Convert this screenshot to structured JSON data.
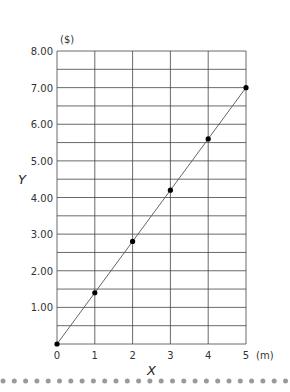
{
  "chart_data": {
    "type": "line",
    "title": "",
    "xlabel": "X",
    "ylabel": "Y",
    "x_unit": "(m)",
    "y_unit": "($)",
    "x": [
      0,
      1,
      2,
      3,
      4,
      5
    ],
    "series": [
      {
        "name": "Y",
        "values": [
          0,
          1.4,
          2.8,
          4.2,
          5.6,
          7.0
        ]
      }
    ],
    "xlim": [
      0,
      5
    ],
    "ylim": [
      0,
      8
    ],
    "x_ticks": [
      "0",
      "1",
      "2",
      "3",
      "4",
      "5"
    ],
    "y_ticks": [
      "1.00",
      "2.00",
      "3.00",
      "4.00",
      "5.00",
      "6.00",
      "7.00",
      "8.00"
    ],
    "grid": true,
    "y_minor_grid_step": 0.5,
    "legend": "none"
  },
  "colors": {
    "grid": "#444444",
    "line": "#555555",
    "marker": "#000000",
    "dots": "#9a9a9a"
  }
}
